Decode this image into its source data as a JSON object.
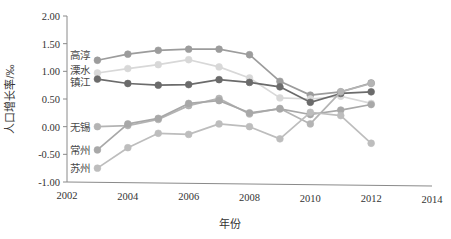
{
  "chart_data": {
    "type": "line",
    "title": "",
    "xlabel": "年份",
    "ylabel": "人口增长率/‰",
    "xlim": [
      2002,
      2014
    ],
    "ylim": [
      -1.0,
      2.0
    ],
    "xticks": [
      2002,
      2004,
      2006,
      2008,
      2010,
      2012,
      2014
    ],
    "xtick_labels": [
      "2002",
      "2004",
      "2006",
      "2008",
      "2010",
      "2012",
      "2014"
    ],
    "yticks": [
      -1.0,
      -0.5,
      0.0,
      0.5,
      1.0,
      1.5,
      2.0
    ],
    "ytick_labels": [
      "-1.00",
      "-0.50",
      "0.00",
      "0.50",
      "1.00",
      "1.50",
      "2.00"
    ],
    "grid": false,
    "legend_position": "inline-left",
    "x": [
      2003,
      2004,
      2005,
      2006,
      2007,
      2008,
      2009,
      2010,
      2011,
      2012
    ],
    "series": [
      {
        "name": "高淳",
        "color": "#9c9c9c",
        "label_x": 2003,
        "label_y": 1.3,
        "values": [
          1.2,
          1.31,
          1.38,
          1.4,
          1.4,
          1.3,
          0.82,
          0.57,
          0.63,
          0.79
        ]
      },
      {
        "name": "溧水",
        "color": "#d8d8d8",
        "label_x": 2003,
        "label_y": 1.03,
        "values": [
          0.97,
          1.05,
          1.12,
          1.21,
          1.08,
          0.88,
          0.52,
          0.5,
          0.55,
          0.42
        ]
      },
      {
        "name": "镇江",
        "color": "#6b6b6b",
        "label_x": 2003,
        "label_y": 0.8,
        "values": [
          0.86,
          0.78,
          0.75,
          0.76,
          0.85,
          0.8,
          0.72,
          0.44,
          0.6,
          0.63
        ]
      },
      {
        "name": "无锡",
        "color": "#b4b4b4",
        "label_x": 2003,
        "label_y": 0.0,
        "values": [
          0.0,
          0.02,
          0.13,
          0.38,
          0.51,
          0.23,
          0.33,
          0.05,
          0.63,
          0.78
        ]
      },
      {
        "name": "常州",
        "color": "#a8a8a8",
        "label_x": 2003,
        "label_y": -0.42,
        "values": [
          -0.42,
          0.05,
          0.15,
          0.42,
          0.47,
          0.25,
          0.32,
          0.22,
          0.3,
          0.4
        ]
      },
      {
        "name": "苏州",
        "color": "#bdbdbd",
        "label_x": 2003,
        "label_y": -0.75,
        "values": [
          -0.75,
          -0.38,
          -0.12,
          -0.14,
          0.05,
          0.0,
          -0.22,
          0.26,
          0.2,
          -0.3
        ]
      }
    ]
  }
}
